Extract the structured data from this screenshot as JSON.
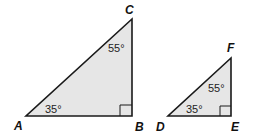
{
  "diagram": {
    "colors": {
      "fill": "#e6e6e6",
      "stroke": "#1a1a1a"
    },
    "triangles": [
      {
        "name": "ABC",
        "vertices": {
          "A": "A",
          "B": "B",
          "C": "C"
        },
        "angles": {
          "A": "35°",
          "C": "55°",
          "B": "right angle"
        }
      },
      {
        "name": "DEF",
        "vertices": {
          "D": "D",
          "E": "E",
          "F": "F"
        },
        "angles": {
          "D": "35°",
          "F": "55°",
          "E": "right angle"
        }
      }
    ]
  }
}
